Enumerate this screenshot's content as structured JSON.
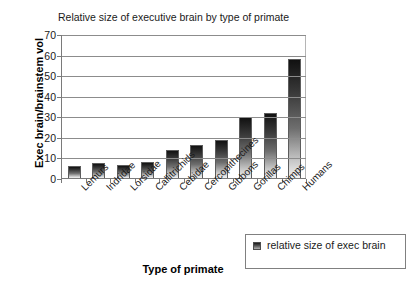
{
  "chart_data": {
    "type": "bar",
    "title": "Relative size of executive brain by type of primate",
    "xlabel": "Type of primate",
    "ylabel": "Exec brain/brainstem vol",
    "categories": [
      "Lemurs",
      "Indridae",
      "Lorsidae",
      "Callitrichids",
      "Cebidae",
      "Cercopithecines",
      "Gibbons",
      "Gorillas",
      "Chimps",
      "Humans"
    ],
    "series": [
      {
        "name": "relative size of exec brain",
        "values": [
          6,
          7.2,
          6.4,
          7.6,
          13.5,
          16,
          18.5,
          29.5,
          31.5,
          58
        ]
      }
    ],
    "ylim": [
      0,
      70
    ],
    "yticks": [
      0,
      10,
      20,
      30,
      40,
      50,
      60,
      70
    ],
    "ytick_labels": [
      "0",
      "10",
      "20",
      "30",
      "40",
      "50",
      "60",
      "70"
    ],
    "grid": "horizontal",
    "legend_position": "bottom-right",
    "bar_style": "vertical-gradient-dark-to-light"
  },
  "legend": {
    "entries": [
      {
        "label": "relative size of exec brain",
        "swatch": "gradient-swatch"
      }
    ]
  }
}
